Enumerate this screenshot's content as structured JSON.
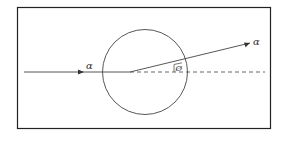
{
  "diagram": {
    "incoming_label": "α",
    "outgoing_label": "α",
    "angle_label": "Ø",
    "colors": {
      "stroke": "#333333",
      "background": "#ffffff"
    }
  }
}
